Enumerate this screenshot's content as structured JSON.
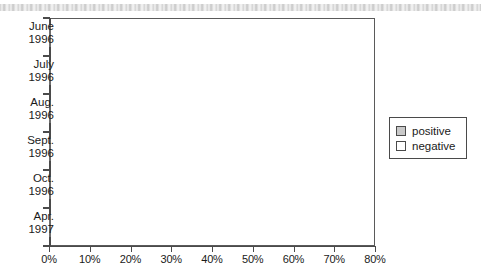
{
  "chart_data": {
    "type": "bar",
    "orientation": "horizontal",
    "title": "",
    "xlabel": "",
    "ylabel": "",
    "categories": [
      "June 1996",
      "July 1996",
      "Aug. 1996",
      "Sept. 1996",
      "Oct. 1996",
      "Apr. 1997"
    ],
    "category_lines": [
      [
        "June",
        "1996"
      ],
      [
        "July",
        "1996"
      ],
      [
        "Aug.",
        "1996"
      ],
      [
        "Sept.",
        "1996"
      ],
      [
        "Oct.",
        "1996"
      ],
      [
        "Apr.",
        "1997"
      ]
    ],
    "series": [
      {
        "name": "positive",
        "color": "#c9c9c9",
        "values": [
          49,
          62,
          62.5,
          63.5,
          65,
          72
        ]
      },
      {
        "name": "negative",
        "color": "#ffffff",
        "values": [
          53,
          39,
          38,
          37,
          34.5,
          28
        ]
      }
    ],
    "xlim": [
      0,
      80
    ],
    "xticks": [
      0,
      10,
      20,
      30,
      40,
      50,
      60,
      70,
      80
    ],
    "xtick_labels": [
      "0%",
      "10%",
      "20%",
      "30%",
      "40%",
      "50%",
      "60%",
      "70%",
      "80%"
    ],
    "grid": false,
    "legend_position": "right",
    "value_suffix": "%"
  },
  "legend": {
    "items": [
      {
        "label": "positive",
        "swatch": "positive"
      },
      {
        "label": "negative",
        "swatch": "negative"
      }
    ]
  }
}
